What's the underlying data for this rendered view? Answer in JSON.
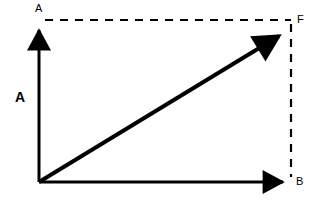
{
  "diagram": {
    "background_color": "#ffffff",
    "stroke_color": "#000000",
    "labels": {
      "axis_top": "A",
      "axis_right": "B",
      "resultant": "F",
      "magnitude": "A"
    },
    "geometry": {
      "origin": {
        "x": 39,
        "y": 182
      },
      "vertical_axis_tip": {
        "x": 39,
        "y": 22
      },
      "horizontal_axis_tip": {
        "x": 292,
        "y": 182
      },
      "resultant_tip": {
        "x": 289,
        "y": 27
      },
      "dashed_corner": {
        "x": 291,
        "y": 20
      }
    },
    "strokes": {
      "axis_width": 3,
      "vector_width": 4,
      "dash_width": 2,
      "dash_pattern": "8 7"
    },
    "elements": {
      "vertical_axis": "vertical-axis-arrow",
      "horizontal_axis": "horizontal-axis-arrow",
      "resultant_vector": "resultant-vector-arrow",
      "dashed_horizontal": "dashed-horizontal-projection",
      "dashed_vertical": "dashed-vertical-projection"
    }
  }
}
